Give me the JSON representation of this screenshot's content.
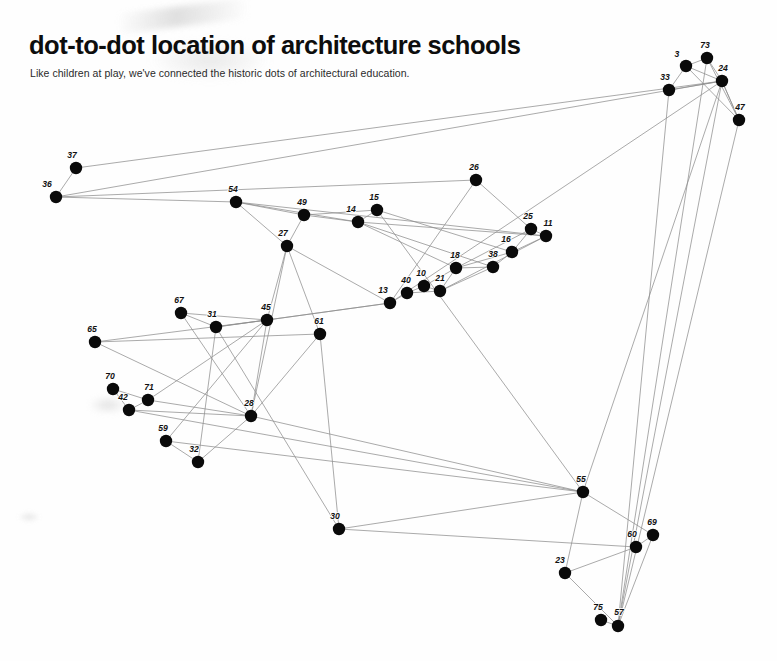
{
  "header": {
    "title": "dot-to-dot location of architecture schools",
    "subtitle": "Like children at play, we've connected the historic dots of architectural education."
  },
  "colors": {
    "background": "#fefefe",
    "dot": "#0a0a0a",
    "edge": "#8e8e8e",
    "text": "#111111"
  },
  "chart_data": {
    "type": "scatter",
    "title": "dot-to-dot location of architecture schools",
    "subtitle": "Like children at play, we've connected the historic dots of architectural education.",
    "xlabel": "",
    "ylabel": "",
    "xlim": [
      0,
      777
    ],
    "ylim": [
      0,
      661
    ],
    "grid": false,
    "legend": "none",
    "axes_visible": false,
    "dot_radius": 6.2,
    "note": "Node coordinates are pixel positions in the 777x661 image; y increases downward. Each node is a labelled dot connected by straight hairlines to other dots.",
    "nodes": [
      {
        "label": "3",
        "x": 686,
        "y": 66,
        "label_dx": -9,
        "label_dy": -9
      },
      {
        "label": "73",
        "x": 707,
        "y": 58,
        "label_dx": -2,
        "label_dy": -10
      },
      {
        "label": "24",
        "x": 722,
        "y": 81,
        "label_dx": 1,
        "label_dy": -10
      },
      {
        "label": "33",
        "x": 669,
        "y": 90,
        "label_dx": -4,
        "label_dy": -10
      },
      {
        "label": "47",
        "x": 739,
        "y": 120,
        "label_dx": 1,
        "label_dy": -10
      },
      {
        "label": "37",
        "x": 76,
        "y": 168,
        "label_dx": -4,
        "label_dy": -10
      },
      {
        "label": "36",
        "x": 56,
        "y": 197,
        "label_dx": -9,
        "label_dy": -10
      },
      {
        "label": "26",
        "x": 476,
        "y": 180,
        "label_dx": -2,
        "label_dy": -10
      },
      {
        "label": "54",
        "x": 236,
        "y": 202,
        "label_dx": -3,
        "label_dy": -10
      },
      {
        "label": "15",
        "x": 377,
        "y": 210,
        "label_dx": -3,
        "label_dy": -10
      },
      {
        "label": "49",
        "x": 304,
        "y": 215,
        "label_dx": -2,
        "label_dy": -10
      },
      {
        "label": "14",
        "x": 358,
        "y": 222,
        "label_dx": -7,
        "label_dy": -10
      },
      {
        "label": "25",
        "x": 531,
        "y": 229,
        "label_dx": -3,
        "label_dy": -10
      },
      {
        "label": "11",
        "x": 546,
        "y": 236,
        "label_dx": 2,
        "label_dy": -10
      },
      {
        "label": "27",
        "x": 287,
        "y": 246,
        "label_dx": -4,
        "label_dy": -10
      },
      {
        "label": "16",
        "x": 512,
        "y": 252,
        "label_dx": -6,
        "label_dy": -10
      },
      {
        "label": "38",
        "x": 493,
        "y": 267,
        "label_dx": 0,
        "label_dy": -10
      },
      {
        "label": "18",
        "x": 456,
        "y": 268,
        "label_dx": -1,
        "label_dy": -10
      },
      {
        "label": "10",
        "x": 424,
        "y": 286,
        "label_dx": -3,
        "label_dy": -10
      },
      {
        "label": "21",
        "x": 440,
        "y": 291,
        "label_dx": 0,
        "label_dy": -10
      },
      {
        "label": "40",
        "x": 407,
        "y": 293,
        "label_dx": -1,
        "label_dy": -10
      },
      {
        "label": "13",
        "x": 390,
        "y": 303,
        "label_dx": -7,
        "label_dy": -10
      },
      {
        "label": "67",
        "x": 181,
        "y": 313,
        "label_dx": -2,
        "label_dy": -10
      },
      {
        "label": "31",
        "x": 216,
        "y": 327,
        "label_dx": -4,
        "label_dy": -10
      },
      {
        "label": "45",
        "x": 267,
        "y": 320,
        "label_dx": -1,
        "label_dy": -10
      },
      {
        "label": "61",
        "x": 320,
        "y": 334,
        "label_dx": -1,
        "label_dy": -10
      },
      {
        "label": "65",
        "x": 95,
        "y": 342,
        "label_dx": -3,
        "label_dy": -10
      },
      {
        "label": "70",
        "x": 113,
        "y": 389,
        "label_dx": -3,
        "label_dy": -10
      },
      {
        "label": "71",
        "x": 148,
        "y": 400,
        "label_dx": 1,
        "label_dy": -10
      },
      {
        "label": "42",
        "x": 129,
        "y": 410,
        "label_dx": -6,
        "label_dy": -10
      },
      {
        "label": "28",
        "x": 251,
        "y": 416,
        "label_dx": -2,
        "label_dy": -10
      },
      {
        "label": "59",
        "x": 166,
        "y": 441,
        "label_dx": -3,
        "label_dy": -10
      },
      {
        "label": "32",
        "x": 198,
        "y": 462,
        "label_dx": -4,
        "label_dy": -10
      },
      {
        "label": "55",
        "x": 583,
        "y": 492,
        "label_dx": -2,
        "label_dy": -10
      },
      {
        "label": "30",
        "x": 339,
        "y": 529,
        "label_dx": -4,
        "label_dy": -10
      },
      {
        "label": "69",
        "x": 653,
        "y": 535,
        "label_dx": -1,
        "label_dy": -10
      },
      {
        "label": "60",
        "x": 636,
        "y": 547,
        "label_dx": -4,
        "label_dy": -10
      },
      {
        "label": "23",
        "x": 565,
        "y": 573,
        "label_dx": -5,
        "label_dy": -10
      },
      {
        "label": "75",
        "x": 601,
        "y": 620,
        "label_dx": -3,
        "label_dy": -10
      },
      {
        "label": "57",
        "x": 618,
        "y": 626,
        "label_dx": 1,
        "label_dy": -11
      }
    ],
    "edges": [
      [
        "37",
        "36"
      ],
      [
        "37",
        "24"
      ],
      [
        "36",
        "24"
      ],
      [
        "36",
        "54"
      ],
      [
        "54",
        "49"
      ],
      [
        "54",
        "27"
      ],
      [
        "54",
        "14"
      ],
      [
        "54",
        "11"
      ],
      [
        "49",
        "14"
      ],
      [
        "49",
        "15"
      ],
      [
        "49",
        "27"
      ],
      [
        "27",
        "45"
      ],
      [
        "27",
        "13"
      ],
      [
        "27",
        "28"
      ],
      [
        "27",
        "61"
      ],
      [
        "15",
        "14"
      ],
      [
        "15",
        "16"
      ],
      [
        "15",
        "55"
      ],
      [
        "14",
        "18"
      ],
      [
        "14",
        "38"
      ],
      [
        "14",
        "11"
      ],
      [
        "26",
        "25"
      ],
      [
        "26",
        "13"
      ],
      [
        "26",
        "36"
      ],
      [
        "25",
        "16"
      ],
      [
        "25",
        "11"
      ],
      [
        "25",
        "18"
      ],
      [
        "11",
        "16"
      ],
      [
        "11",
        "21"
      ],
      [
        "16",
        "38"
      ],
      [
        "16",
        "18"
      ],
      [
        "38",
        "18"
      ],
      [
        "38",
        "21"
      ],
      [
        "18",
        "21"
      ],
      [
        "18",
        "10"
      ],
      [
        "10",
        "21"
      ],
      [
        "10",
        "40"
      ],
      [
        "21",
        "40"
      ],
      [
        "40",
        "13"
      ],
      [
        "13",
        "45"
      ],
      [
        "13",
        "31"
      ],
      [
        "67",
        "31"
      ],
      [
        "67",
        "45"
      ],
      [
        "67",
        "28"
      ],
      [
        "31",
        "45"
      ],
      [
        "31",
        "32"
      ],
      [
        "31",
        "30"
      ],
      [
        "45",
        "28"
      ],
      [
        "45",
        "71"
      ],
      [
        "45",
        "59"
      ],
      [
        "65",
        "45"
      ],
      [
        "65",
        "61"
      ],
      [
        "65",
        "28"
      ],
      [
        "61",
        "28"
      ],
      [
        "61",
        "30"
      ],
      [
        "70",
        "71"
      ],
      [
        "70",
        "42"
      ],
      [
        "71",
        "42"
      ],
      [
        "71",
        "28"
      ],
      [
        "42",
        "28"
      ],
      [
        "42",
        "55"
      ],
      [
        "59",
        "32"
      ],
      [
        "59",
        "55"
      ],
      [
        "32",
        "28"
      ],
      [
        "28",
        "55"
      ],
      [
        "30",
        "60"
      ],
      [
        "30",
        "55"
      ],
      [
        "55",
        "24"
      ],
      [
        "55",
        "69"
      ],
      [
        "55",
        "23"
      ],
      [
        "60",
        "69"
      ],
      [
        "60",
        "23"
      ],
      [
        "69",
        "57"
      ],
      [
        "23",
        "57"
      ],
      [
        "75",
        "57"
      ],
      [
        "57",
        "47"
      ],
      [
        "57",
        "24"
      ],
      [
        "57",
        "73"
      ],
      [
        "3",
        "73"
      ],
      [
        "3",
        "24"
      ],
      [
        "73",
        "24"
      ],
      [
        "33",
        "24"
      ],
      [
        "33",
        "3"
      ],
      [
        "24",
        "47"
      ],
      [
        "47",
        "24"
      ],
      [
        "33",
        "57"
      ],
      [
        "24",
        "13"
      ],
      [
        "73",
        "47"
      ],
      [
        "3",
        "47"
      ]
    ]
  }
}
